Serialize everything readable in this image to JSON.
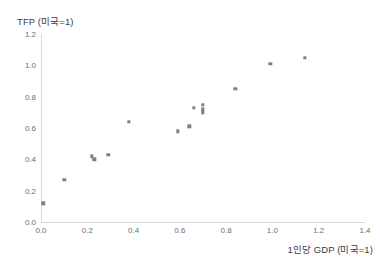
{
  "chart_data": {
    "type": "scatter",
    "title": "",
    "xlabel": "1인당 GDP (미국=1)",
    "ylabel": "TFP (미국=1)",
    "xlim": [
      0.0,
      1.4
    ],
    "ylim": [
      0.0,
      1.2
    ],
    "xticks": [
      "0.0",
      "0.2",
      "0.4",
      "0.6",
      "0.8",
      "1.0",
      "1.2",
      "1.4"
    ],
    "yticks": [
      "0.0",
      "0.2",
      "0.4",
      "0.6",
      "0.8",
      "1.0",
      "1.2"
    ],
    "xtick_values": [
      0.0,
      0.2,
      0.4,
      0.6,
      0.8,
      1.0,
      1.2,
      1.4
    ],
    "ytick_values": [
      0.0,
      0.2,
      0.4,
      0.6,
      0.8,
      1.0,
      1.2
    ],
    "grid": false,
    "legend": false,
    "marker_color": "#7f7f7f",
    "axis_color": "#d9d9d9",
    "series": [
      {
        "name": "국가별 TFP 대 1인당 GDP",
        "points": [
          {
            "x": 0.01,
            "y": 0.12
          },
          {
            "x": 0.1,
            "y": 0.27
          },
          {
            "x": 0.22,
            "y": 0.42
          },
          {
            "x": 0.23,
            "y": 0.4
          },
          {
            "x": 0.29,
            "y": 0.43
          },
          {
            "x": 0.38,
            "y": 0.64
          },
          {
            "x": 0.59,
            "y": 0.58
          },
          {
            "x": 0.64,
            "y": 0.61
          },
          {
            "x": 0.66,
            "y": 0.73
          },
          {
            "x": 0.7,
            "y": 0.75
          },
          {
            "x": 0.7,
            "y": 0.72
          },
          {
            "x": 0.7,
            "y": 0.7
          },
          {
            "x": 0.84,
            "y": 0.85
          },
          {
            "x": 0.99,
            "y": 1.01
          },
          {
            "x": 1.14,
            "y": 1.05
          }
        ]
      }
    ]
  }
}
